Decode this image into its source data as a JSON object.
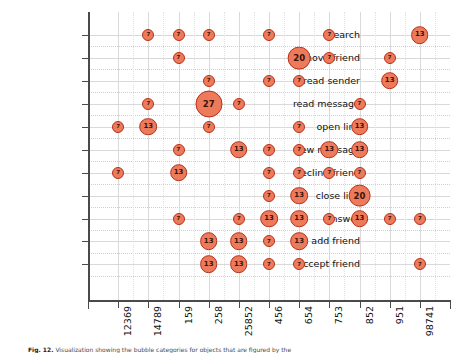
{
  "chart_data": {
    "type": "scatter",
    "title": "",
    "xlabel": "",
    "ylabel": "",
    "grid": true,
    "legend": "none",
    "bubble_value_labels": true,
    "categories": [
      "12369",
      "14789",
      "159",
      "258",
      "25852",
      "456",
      "654",
      "753",
      "852",
      "951",
      "98741"
    ],
    "y_categories": [
      "search",
      "remove friend",
      "read sender",
      "read message",
      "open link",
      "new message",
      "decline friend",
      "close link",
      "answer",
      "add friend",
      "accept friend"
    ],
    "value_range": [
      7,
      27
    ],
    "points": [
      {
        "y": "search",
        "x": "14789",
        "v": 7
      },
      {
        "y": "search",
        "x": "159",
        "v": 7
      },
      {
        "y": "search",
        "x": "258",
        "v": 7
      },
      {
        "y": "search",
        "x": "456",
        "v": 7
      },
      {
        "y": "search",
        "x": "753",
        "v": 7
      },
      {
        "y": "search",
        "x": "98741",
        "v": 13
      },
      {
        "y": "remove friend",
        "x": "159",
        "v": 7
      },
      {
        "y": "remove friend",
        "x": "654",
        "v": 20
      },
      {
        "y": "remove friend",
        "x": "753",
        "v": 7
      },
      {
        "y": "remove friend",
        "x": "951",
        "v": 7
      },
      {
        "y": "read sender",
        "x": "258",
        "v": 7
      },
      {
        "y": "read sender",
        "x": "456",
        "v": 7
      },
      {
        "y": "read sender",
        "x": "654",
        "v": 7
      },
      {
        "y": "read sender",
        "x": "951",
        "v": 13
      },
      {
        "y": "read message",
        "x": "14789",
        "v": 7
      },
      {
        "y": "read message",
        "x": "258",
        "v": 27
      },
      {
        "y": "read message",
        "x": "25852",
        "v": 7
      },
      {
        "y": "read message",
        "x": "852",
        "v": 7
      },
      {
        "y": "open link",
        "x": "12369",
        "v": 7
      },
      {
        "y": "open link",
        "x": "14789",
        "v": 13
      },
      {
        "y": "open link",
        "x": "258",
        "v": 7
      },
      {
        "y": "open link",
        "x": "654",
        "v": 7
      },
      {
        "y": "open link",
        "x": "852",
        "v": 13
      },
      {
        "y": "new message",
        "x": "159",
        "v": 7
      },
      {
        "y": "new message",
        "x": "25852",
        "v": 13
      },
      {
        "y": "new message",
        "x": "456",
        "v": 7
      },
      {
        "y": "new message",
        "x": "654",
        "v": 7
      },
      {
        "y": "new message",
        "x": "753",
        "v": 13
      },
      {
        "y": "new message",
        "x": "852",
        "v": 13
      },
      {
        "y": "decline friend",
        "x": "12369",
        "v": 7
      },
      {
        "y": "decline friend",
        "x": "159",
        "v": 13
      },
      {
        "y": "decline friend",
        "x": "456",
        "v": 7
      },
      {
        "y": "decline friend",
        "x": "654",
        "v": 7
      },
      {
        "y": "decline friend",
        "x": "753",
        "v": 7
      },
      {
        "y": "decline friend",
        "x": "852",
        "v": 7
      },
      {
        "y": "close link",
        "x": "456",
        "v": 7
      },
      {
        "y": "close link",
        "x": "654",
        "v": 13
      },
      {
        "y": "close link",
        "x": "852",
        "v": 20
      },
      {
        "y": "answer",
        "x": "159",
        "v": 7
      },
      {
        "y": "answer",
        "x": "25852",
        "v": 7
      },
      {
        "y": "answer",
        "x": "456",
        "v": 13
      },
      {
        "y": "answer",
        "x": "654",
        "v": 13
      },
      {
        "y": "answer",
        "x": "753",
        "v": 7
      },
      {
        "y": "answer",
        "x": "852",
        "v": 13
      },
      {
        "y": "answer",
        "x": "951",
        "v": 7
      },
      {
        "y": "answer",
        "x": "98741",
        "v": 7
      },
      {
        "y": "add friend",
        "x": "258",
        "v": 13
      },
      {
        "y": "add friend",
        "x": "25852",
        "v": 13
      },
      {
        "y": "add friend",
        "x": "456",
        "v": 7
      },
      {
        "y": "add friend",
        "x": "654",
        "v": 13
      },
      {
        "y": "accept friend",
        "x": "258",
        "v": 13
      },
      {
        "y": "accept friend",
        "x": "25852",
        "v": 13
      },
      {
        "y": "accept friend",
        "x": "456",
        "v": 7
      },
      {
        "y": "accept friend",
        "x": "654",
        "v": 7
      },
      {
        "y": "accept friend",
        "x": "98741",
        "v": 7
      }
    ],
    "colors": {
      "bubble_fill": "#ee7a5c",
      "bubble_stroke": "#b3311a",
      "bubble_text": "#3a1408",
      "grid": "#d9d9d9",
      "axis": "#4a4a4a",
      "background": "#ffffff"
    }
  },
  "caption": {
    "label": "Fig. 12.",
    "text": "Visualization showing the bubble categories for objects that are figured by the"
  }
}
